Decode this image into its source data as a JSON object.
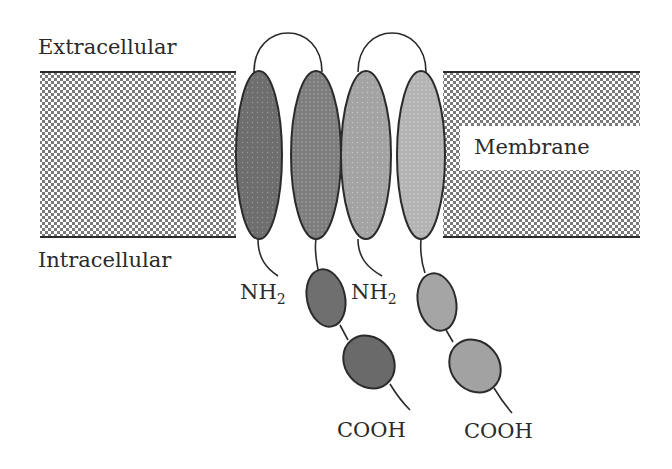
{
  "diagram": {
    "labels": {
      "extracellular": "Extracellular",
      "intracellular": "Intracellular",
      "membrane": "Membrane",
      "n_terminus_1": "NH",
      "n_terminus_2": "NH",
      "subscript": "2",
      "c_terminus_1": "COOH",
      "c_terminus_2": "COOH"
    },
    "colors": {
      "membrane_dark": "#7a7a7a",
      "membrane_light": "#ffffff",
      "outline": "#2b2b2b",
      "helix_1": "#6e6e6e",
      "helix_2": "#7d7d7d",
      "helix_3": "#a3a3a3",
      "helix_4": "#b3b3b3"
    },
    "subunits": [
      {
        "name": "subunit-1",
        "helices": [
          "helix-1",
          "helix-2"
        ],
        "intracellular_domains": 2,
        "shade": "dark"
      },
      {
        "name": "subunit-2",
        "helices": [
          "helix-3",
          "helix-4"
        ],
        "intracellular_domains": 2,
        "shade": "light"
      }
    ]
  }
}
